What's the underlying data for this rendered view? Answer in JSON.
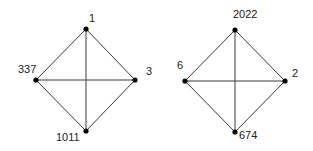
{
  "graphs": [
    {
      "name": "left-graph",
      "nodes": [
        {
          "id": "top",
          "label": "1",
          "x": 86,
          "y": 29
        },
        {
          "id": "right",
          "label": "3",
          "x": 135,
          "y": 80
        },
        {
          "id": "bottom",
          "label": "1011",
          "x": 86,
          "y": 131
        },
        {
          "id": "left",
          "label": "337",
          "x": 36,
          "y": 80
        }
      ]
    },
    {
      "name": "right-graph",
      "nodes": [
        {
          "id": "top",
          "label": "2022",
          "x": 235,
          "y": 30
        },
        {
          "id": "right",
          "label": "2",
          "x": 285,
          "y": 81
        },
        {
          "id": "bottom",
          "label": "674",
          "x": 235,
          "y": 132
        },
        {
          "id": "left",
          "label": "6",
          "x": 185,
          "y": 81
        }
      ]
    }
  ],
  "edges": [
    [
      "top",
      "right"
    ],
    [
      "right",
      "bottom"
    ],
    [
      "bottom",
      "left"
    ],
    [
      "left",
      "top"
    ],
    [
      "top",
      "bottom"
    ],
    [
      "left",
      "right"
    ]
  ]
}
